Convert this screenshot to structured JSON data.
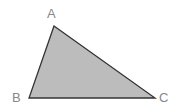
{
  "diagram": {
    "type": "triangle",
    "fill_color": "#bcbcbc",
    "stroke_color": "#333333",
    "label_color": "#888888",
    "vertices": [
      {
        "name": "A",
        "x": 54,
        "y": 26
      },
      {
        "name": "B",
        "x": 29,
        "y": 98
      },
      {
        "name": "C",
        "x": 155,
        "y": 98
      }
    ],
    "labels": {
      "a": "A",
      "b": "B",
      "c": "C"
    }
  }
}
